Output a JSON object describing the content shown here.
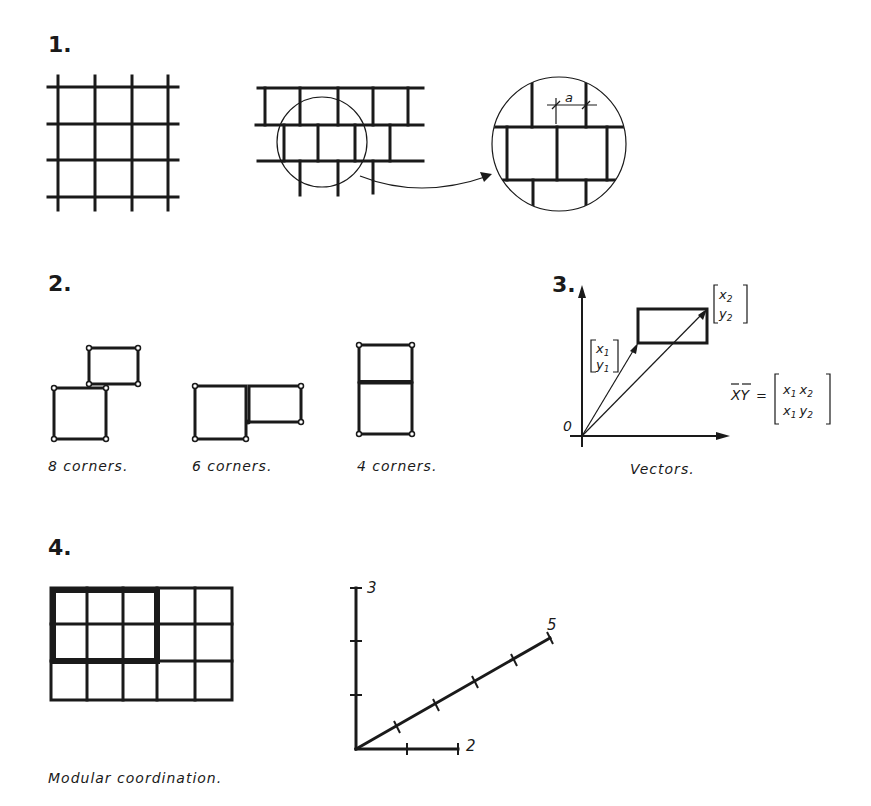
{
  "figure1": {
    "number": "1.",
    "dimension_label": "a"
  },
  "figure2": {
    "number": "2.",
    "captions": [
      "8 corners.",
      "6 corners.",
      "4 corners."
    ]
  },
  "figure3": {
    "number": "3.",
    "origin_label": "0",
    "vector1": {
      "top": "x",
      "top_sub": "1",
      "bottom": "y",
      "bottom_sub": "1"
    },
    "vector2": {
      "top": "x",
      "top_sub": "2",
      "bottom": "y",
      "bottom_sub": "2"
    },
    "equation": {
      "lhs": "XY",
      "equals": "=",
      "row1": [
        "x",
        "1",
        "x",
        "2"
      ],
      "row2": [
        "x",
        "1",
        "y",
        "2"
      ]
    },
    "caption": "Vectors."
  },
  "figure4": {
    "number": "4.",
    "grid": {
      "columns": 5,
      "rows": 3,
      "highlight_columns": 3,
      "highlight_rows": 2
    },
    "axes": {
      "vertical_label": "3",
      "horizontal_label": "2",
      "diagonal_label": "5"
    },
    "caption": "Modular coordination."
  }
}
